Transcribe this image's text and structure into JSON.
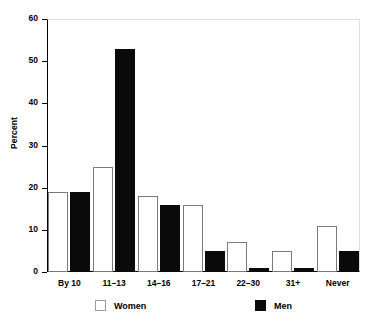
{
  "chart_data": {
    "type": "bar",
    "title": "",
    "subtitle": "",
    "xlabel": "",
    "ylabel": "Percent",
    "ylim": [
      0,
      60
    ],
    "yticks": [
      0,
      10,
      20,
      30,
      40,
      50,
      60
    ],
    "ytick_labels": [
      "0",
      "10",
      "20",
      "30",
      "40",
      "50",
      "60"
    ],
    "grid": false,
    "legend_position": "bottom",
    "categories": [
      "By 10",
      "11–13",
      "14–16",
      "17–21",
      "22–30",
      "31+",
      "Never"
    ],
    "series": [
      {
        "name": "Women",
        "color": "#ffffff",
        "edge_color": "#7a7a7a",
        "values": [
          19,
          25,
          18,
          16,
          7,
          5,
          11
        ]
      },
      {
        "name": "Men",
        "color": "#0a0a0a",
        "edge_color": "#0a0a0a",
        "values": [
          19,
          53,
          16,
          5,
          1,
          1,
          5
        ]
      }
    ]
  },
  "legend": {
    "items": [
      {
        "label": "Women",
        "swatch": "women"
      },
      {
        "label": "Men",
        "swatch": "men"
      }
    ]
  },
  "colors": {
    "background": "#ffffff",
    "axis": "#000000",
    "frame_light": "#dededd",
    "men_fill": "#0a0a0a",
    "women_fill": "#ffffff",
    "women_edge": "#7a7a7a"
  }
}
